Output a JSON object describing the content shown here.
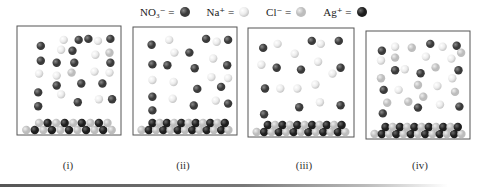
{
  "legend": [
    {
      "formula": "NO₃⁻",
      "eq": "=",
      "ion": "nitrate",
      "color": "#3a3a3a",
      "highlight": "#8a8a8a"
    },
    {
      "formula": "Na⁺",
      "eq": "=",
      "ion": "sodium",
      "color": "#ececec",
      "highlight": "#ffffff",
      "shade": "#c8c8c8"
    },
    {
      "formula": "Cl⁻",
      "eq": "=",
      "ion": "chloride",
      "color": "#bdbdbd",
      "highlight": "#eeeeee"
    },
    {
      "formula": "Ag⁺",
      "eq": "=",
      "ion": "silver",
      "color": "#1e1e1e",
      "highlight": "#6a6a6a"
    }
  ],
  "panels": [
    {
      "label": "(i)",
      "ions": [
        [
          "nitrate",
          0.18,
          0.14
        ],
        [
          "sodium",
          0.44,
          0.08
        ],
        [
          "nitrate",
          0.61,
          0.08
        ],
        [
          "nitrate",
          0.72,
          0.07
        ],
        [
          "sodium",
          0.83,
          0.09
        ],
        [
          "nitrate",
          0.97,
          0.07
        ],
        [
          "sodium",
          0.41,
          0.18
        ],
        [
          "nitrate",
          0.54,
          0.19
        ],
        [
          "sodium",
          0.8,
          0.23
        ],
        [
          "chloride",
          0.96,
          0.21
        ],
        [
          "nitrate",
          0.18,
          0.29
        ],
        [
          "nitrate",
          0.36,
          0.31
        ],
        [
          "nitrate",
          0.56,
          0.31
        ],
        [
          "nitrate",
          0.97,
          0.31
        ],
        [
          "sodium",
          0.16,
          0.42
        ],
        [
          "sodium",
          0.36,
          0.44
        ],
        [
          "chloride",
          0.53,
          0.41
        ],
        [
          "sodium",
          0.79,
          0.4
        ],
        [
          "sodium",
          0.96,
          0.41
        ],
        [
          "nitrate",
          0.36,
          0.54
        ],
        [
          "nitrate",
          0.64,
          0.52
        ],
        [
          "nitrate",
          0.88,
          0.52
        ],
        [
          "nitrate",
          0.15,
          0.61
        ],
        [
          "sodium",
          0.41,
          0.63
        ],
        [
          "sodium",
          0.84,
          0.68
        ],
        [
          "nitrate",
          0.99,
          0.68
        ],
        [
          "nitrate",
          0.6,
          0.71
        ],
        [
          "nitrate",
          0.15,
          0.75
        ]
      ],
      "precipitate_top": [
        "chloride",
        "silver",
        "chloride",
        "silver",
        "chloride",
        "silver",
        "chloride",
        "silver",
        "chloride"
      ],
      "precipitate_bottom": [
        "chloride",
        "silver",
        "chloride",
        "silver",
        "chloride",
        "silver",
        "chloride",
        "silver",
        "chloride",
        "silver",
        "chloride"
      ]
    },
    {
      "label": "(ii)",
      "ions": [
        [
          "nitrate",
          0.12,
          0.12
        ],
        [
          "sodium",
          0.32,
          0.07
        ],
        [
          "nitrate",
          0.74,
          0.06
        ],
        [
          "sodium",
          0.86,
          0.09
        ],
        [
          "nitrate",
          0.99,
          0.07
        ],
        [
          "sodium",
          0.38,
          0.2
        ],
        [
          "nitrate",
          0.55,
          0.2
        ],
        [
          "sodium",
          0.82,
          0.26
        ],
        [
          "nitrate",
          0.13,
          0.32
        ],
        [
          "nitrate",
          0.3,
          0.33
        ],
        [
          "nitrate",
          0.61,
          0.36
        ],
        [
          "nitrate",
          0.98,
          0.33
        ],
        [
          "sodium",
          0.13,
          0.48
        ],
        [
          "sodium",
          0.37,
          0.5
        ],
        [
          "sodium",
          0.8,
          0.45
        ],
        [
          "sodium",
          0.99,
          0.46
        ],
        [
          "nitrate",
          0.64,
          0.57
        ],
        [
          "nitrate",
          0.91,
          0.55
        ],
        [
          "nitrate",
          0.13,
          0.65
        ],
        [
          "sodium",
          0.36,
          0.67
        ],
        [
          "sodium",
          0.85,
          0.69
        ],
        [
          "nitrate",
          0.99,
          0.72
        ],
        [
          "nitrate",
          0.6,
          0.74
        ],
        [
          "nitrate",
          0.13,
          0.79
        ]
      ],
      "precipitate_top": [
        "silver",
        "chloride",
        "silver",
        "chloride",
        "silver",
        "chloride",
        "silver",
        "chloride",
        "silver",
        "chloride",
        "silver"
      ],
      "precipitate_bottom": [
        "chloride",
        "silver",
        "chloride",
        "silver",
        "chloride",
        "silver",
        "chloride",
        "silver",
        "chloride",
        "silver",
        "chloride",
        "silver",
        "chloride"
      ]
    },
    {
      "label": "(iii)",
      "ions": [
        [
          "nitrate",
          0.08,
          0.14
        ],
        [
          "sodium",
          0.24,
          0.1
        ],
        [
          "nitrate",
          0.62,
          0.07
        ],
        [
          "sodium",
          0.72,
          0.1
        ],
        [
          "nitrate",
          0.92,
          0.07
        ],
        [
          "sodium",
          0.43,
          0.2
        ],
        [
          "sodium",
          0.69,
          0.28
        ],
        [
          "sodium",
          0.06,
          0.31
        ],
        [
          "nitrate",
          0.23,
          0.34
        ],
        [
          "nitrate",
          0.5,
          0.36
        ],
        [
          "nitrate",
          0.94,
          0.34
        ],
        [
          "sodium",
          0.85,
          0.4
        ],
        [
          "nitrate",
          0.1,
          0.55
        ],
        [
          "sodium",
          0.27,
          0.55
        ],
        [
          "sodium",
          0.46,
          0.55
        ],
        [
          "sodium",
          0.66,
          0.51
        ],
        [
          "sodium",
          0.71,
          0.69
        ],
        [
          "nitrate",
          0.48,
          0.74
        ],
        [
          "nitrate",
          0.94,
          0.72
        ],
        [
          "nitrate",
          0.09,
          0.81
        ]
      ],
      "precipitate_top": [
        "silver",
        "chloride",
        "silver",
        "chloride",
        "silver",
        "chloride",
        "silver",
        "chloride",
        "silver",
        "chloride",
        "silver"
      ],
      "precipitate_bottom": [
        "chloride",
        "silver",
        "chloride",
        "silver",
        "chloride",
        "silver",
        "chloride",
        "silver",
        "chloride",
        "silver",
        "chloride",
        "silver",
        "chloride"
      ]
    },
    {
      "label": "(iv)",
      "ions": [
        [
          "nitrate",
          0.09,
          0.14
        ],
        [
          "sodium",
          0.24,
          0.1
        ],
        [
          "chloride",
          0.43,
          0.11
        ],
        [
          "nitrate",
          0.64,
          0.07
        ],
        [
          "sodium",
          0.78,
          0.1
        ],
        [
          "nitrate",
          0.94,
          0.09
        ],
        [
          "chloride",
          0.99,
          0.16
        ],
        [
          "sodium",
          0.08,
          0.24
        ],
        [
          "chloride",
          0.24,
          0.21
        ],
        [
          "sodium",
          0.59,
          0.2
        ],
        [
          "sodium",
          0.88,
          0.22
        ],
        [
          "nitrate",
          0.24,
          0.34
        ],
        [
          "sodium",
          0.35,
          0.33
        ],
        [
          "nitrate",
          0.53,
          0.37
        ],
        [
          "chloride",
          0.7,
          0.31
        ],
        [
          "nitrate",
          0.96,
          0.34
        ],
        [
          "chloride",
          0.08,
          0.42
        ],
        [
          "sodium",
          0.89,
          0.42
        ],
        [
          "nitrate",
          0.11,
          0.54
        ],
        [
          "sodium",
          0.28,
          0.54
        ],
        [
          "chloride",
          0.5,
          0.49
        ],
        [
          "sodium",
          0.72,
          0.5
        ],
        [
          "chloride",
          0.92,
          0.56
        ],
        [
          "chloride",
          0.56,
          0.61
        ],
        [
          "chloride",
          0.15,
          0.67
        ],
        [
          "chloride",
          0.39,
          0.66
        ],
        [
          "sodium",
          0.75,
          0.69
        ],
        [
          "nitrate",
          0.5,
          0.72
        ],
        [
          "nitrate",
          0.97,
          0.71
        ],
        [
          "nitrate",
          0.1,
          0.78
        ]
      ],
      "precipitate_top": [
        "silver",
        "chloride",
        "silver",
        "chloride",
        "silver",
        "chloride",
        "silver",
        "chloride",
        "silver",
        "chloride",
        "silver"
      ],
      "precipitate_bottom": [
        "chloride",
        "silver",
        "chloride",
        "silver",
        "chloride",
        "silver",
        "chloride",
        "silver",
        "chloride",
        "silver",
        "chloride",
        "silver",
        "chloride"
      ]
    }
  ]
}
